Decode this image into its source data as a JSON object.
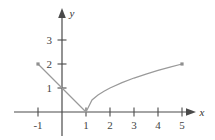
{
  "figure": {
    "width": 215,
    "height": 140,
    "background": "#ffffff"
  },
  "axes": {
    "x_label": "x",
    "y_label": "y",
    "axis_color": "#4a4a4a",
    "x_tick_labels": [
      "-1",
      "1",
      "2",
      "3",
      "4",
      "5"
    ],
    "x_tick_values": [
      -1,
      1,
      2,
      3,
      4,
      5
    ],
    "y_tick_labels": [
      "1",
      "2",
      "3"
    ],
    "y_tick_values": [
      1,
      2,
      3
    ],
    "xlim": [
      -1.8,
      6.2
    ],
    "ylim": [
      -1.1,
      4.4
    ]
  },
  "chart_data": {
    "type": "line",
    "title": "",
    "xlabel": "x",
    "ylabel": "y",
    "xlim": [
      -1.8,
      6.2
    ],
    "ylim": [
      -1.1,
      4.4
    ],
    "grid": false,
    "legend": false,
    "curve_color": "#9a9a9a",
    "series": [
      {
        "name": "left-branch",
        "type": "line",
        "expression": "1 - x",
        "domain": [
          -1,
          1
        ],
        "x": [
          -1,
          -0.75,
          -0.5,
          -0.25,
          0,
          0.25,
          0.5,
          0.75,
          1
        ],
        "values": [
          2,
          1.75,
          1.5,
          1.25,
          1,
          0.75,
          0.5,
          0.25,
          0
        ]
      },
      {
        "name": "right-branch",
        "type": "line",
        "expression": "sqrt(x - 1)",
        "domain": [
          1,
          5
        ],
        "x": [
          1,
          1.25,
          1.5,
          1.75,
          2,
          2.5,
          3,
          3.5,
          4,
          4.5,
          5
        ],
        "values": [
          0,
          0.5,
          0.707,
          0.866,
          1,
          1.225,
          1.414,
          1.581,
          1.732,
          1.871,
          2
        ]
      }
    ],
    "endpoints": [
      {
        "name": "left-endpoint",
        "x": -1,
        "y": 2,
        "style": "dot"
      },
      {
        "name": "right-endpoint",
        "x": 5,
        "y": 2,
        "style": "dot"
      }
    ],
    "vertex": {
      "x": 1,
      "y": 0
    }
  }
}
